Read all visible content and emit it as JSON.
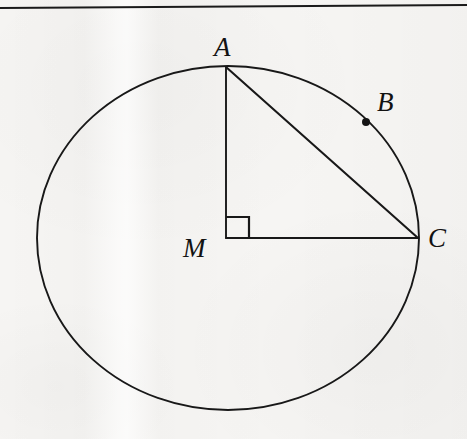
{
  "figure": {
    "background_color": "#f6f5f3",
    "ink_color": "#181818",
    "labels": [
      {
        "id": "A",
        "text": "A",
        "x": 223,
        "y": 47,
        "font_size": 27
      },
      {
        "id": "B",
        "text": "B",
        "x": 386,
        "y": 102,
        "font_size": 27
      },
      {
        "id": "C",
        "text": "C",
        "x": 437,
        "y": 238,
        "font_size": 27
      },
      {
        "id": "M",
        "text": "M",
        "x": 196,
        "y": 248,
        "font_size": 27
      }
    ],
    "top_rule": {
      "name": "page-rule",
      "x1": 0,
      "y1": 8,
      "x2": 467,
      "y2": 5,
      "stroke_width": 1.8
    },
    "circle": {
      "name": "circle-outline",
      "center_x": 228,
      "center_y": 238,
      "radius_x": 191,
      "radius_y": 172,
      "stroke_width": 1.9,
      "fill": "none"
    },
    "points": [
      {
        "id": "A",
        "x": 226,
        "y": 67,
        "marked": false
      },
      {
        "id": "B",
        "x": 366,
        "y": 122,
        "marked": true,
        "dot_radius": 4
      },
      {
        "id": "C",
        "x": 418,
        "y": 238,
        "marked": false
      },
      {
        "id": "M",
        "x": 226,
        "y": 238,
        "marked": false
      }
    ],
    "segments": [
      {
        "id": "MA",
        "from": "M",
        "to": "A",
        "x1": 226,
        "y1": 67,
        "x2": 226,
        "y2": 238,
        "stroke_width": 1.9
      },
      {
        "id": "MC",
        "from": "M",
        "to": "C",
        "x1": 226,
        "y1": 238,
        "x2": 418,
        "y2": 238,
        "stroke_width": 1.9
      },
      {
        "id": "AC",
        "from": "A",
        "to": "C",
        "x1": 226,
        "y1": 67,
        "x2": 418,
        "y2": 238,
        "stroke_width": 2.1
      }
    ],
    "right_angle_marker": {
      "name": "right-angle-square",
      "vertex": "M",
      "points": "226,217 249,217 249,239",
      "size": 23,
      "stroke_width": 2.2
    }
  }
}
